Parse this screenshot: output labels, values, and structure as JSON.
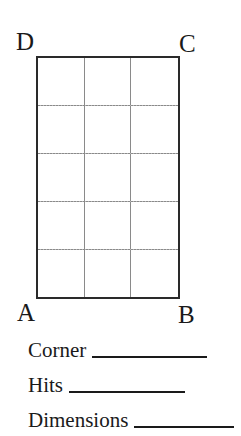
{
  "figure": {
    "corners": {
      "top_left": "D",
      "top_right": "C",
      "bottom_left": "A",
      "bottom_right": "B"
    },
    "grid": {
      "columns": 3,
      "rows": 5
    }
  },
  "fields": [
    {
      "label": "Corner",
      "value": ""
    },
    {
      "label": "Hits",
      "value": ""
    },
    {
      "label": "Dimensions",
      "value": ""
    }
  ]
}
